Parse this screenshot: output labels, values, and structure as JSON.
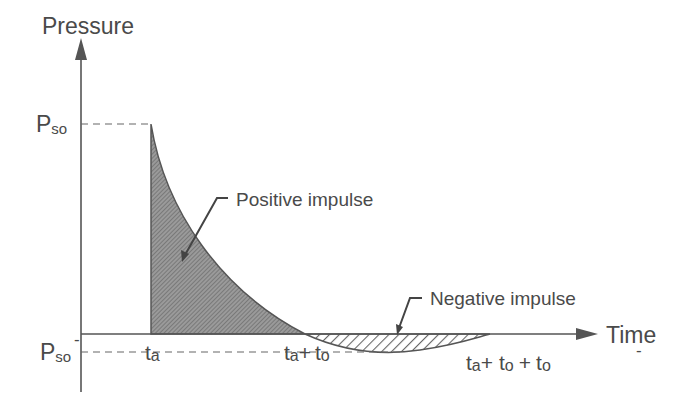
{
  "diagram": {
    "axes": {
      "y_label": "Pressure",
      "x_label": "Time"
    },
    "pressure_levels": {
      "peak_positive": {
        "main": "P",
        "sub": "so",
        "sup": ""
      },
      "peak_negative": {
        "main": "P",
        "sub": "so",
        "sup": "-"
      }
    },
    "time_marks": {
      "arrival": {
        "t1": "t",
        "s1": "a"
      },
      "positive_end": {
        "t1": "t",
        "s1": "a",
        "plus": "+",
        "t2": "t",
        "s2": "o"
      },
      "negative_end": {
        "t1": "t",
        "s1": "a",
        "plus1": "+",
        "t2": "t",
        "s2": "o",
        "plus2": "+",
        "t3": "t",
        "s3": "o",
        "sup3": "-"
      }
    },
    "regions": {
      "positive": "Positive impulse",
      "negative": "Negative impulse"
    },
    "colors": {
      "line": "#555555",
      "text": "#4a4a4a",
      "positive_fill": "#8a8a8a",
      "hatch": "#666666"
    }
  }
}
